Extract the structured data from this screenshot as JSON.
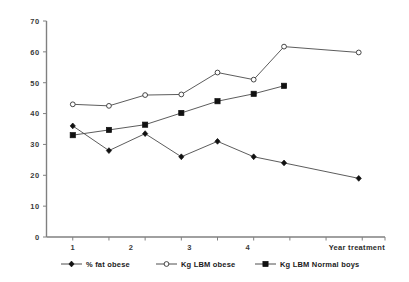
{
  "chart_data": {
    "type": "line",
    "title": "",
    "xlabel": "Year treatment",
    "ylabel": "",
    "ylim": [
      0,
      70
    ],
    "ytick_step": 10,
    "yticks": [
      "0",
      "10",
      "20",
      "30",
      "40",
      "50",
      "60",
      "70"
    ],
    "xlim": [
      0.55,
      6.35
    ],
    "xticks": [
      1,
      2,
      3,
      4
    ],
    "xtick_labels": [
      "1",
      "2",
      "3",
      "4"
    ],
    "grid": false,
    "legend_position": "bottom",
    "series": [
      {
        "name": "% fat obese",
        "marker": "filled-diamond",
        "x": [
          1.0,
          1.62,
          2.24,
          2.86,
          3.48,
          4.1,
          4.62,
          5.9
        ],
        "values": [
          36.0,
          28.0,
          33.5,
          26.0,
          31.0,
          26.0,
          24.0,
          19.0
        ]
      },
      {
        "name": "Kg LBM obese",
        "marker": "open-diamond",
        "x": [
          1.0,
          1.62,
          2.24,
          2.86,
          3.48,
          4.1,
          4.62,
          5.9
        ],
        "values": [
          43.0,
          42.5,
          46.0,
          46.2,
          53.3,
          51.0,
          61.7,
          59.8
        ]
      },
      {
        "name": "Kg LBM Normal boys",
        "marker": "filled-square",
        "x": [
          1.0,
          1.62,
          2.24,
          2.86,
          3.48,
          4.1,
          4.62
        ],
        "values": [
          33.0,
          34.7,
          36.4,
          40.2,
          44.0,
          46.4,
          49.0
        ]
      }
    ]
  },
  "legend": {
    "items": [
      {
        "label": "% fat obese",
        "marker": "filled-diamond"
      },
      {
        "label": "Kg LBM obese",
        "marker": "open-diamond"
      },
      {
        "label": "Kg LBM Normal boys",
        "marker": "filled-square"
      }
    ]
  },
  "colors": {
    "axis": "#808080",
    "line": "#4a4a4a",
    "marker_fill": "#111111",
    "marker_open_fill": "#ffffff",
    "text": "#1b1b1b",
    "background": "#ffffff"
  },
  "axis": {
    "x_title": "Year treatment"
  }
}
